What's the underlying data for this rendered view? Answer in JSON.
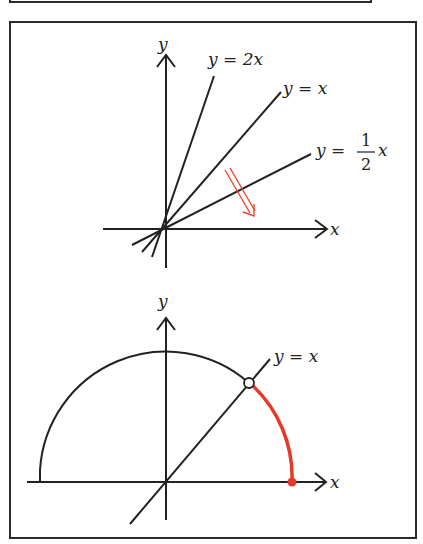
{
  "figure_top": {
    "axis_labels": {
      "x": "x",
      "y": "y"
    },
    "lines": [
      {
        "name": "y = 2x",
        "label": "y = 2x",
        "slope": 2
      },
      {
        "name": "y = x",
        "label": "y = x",
        "slope": 1
      },
      {
        "name": "y = 1/2 x",
        "label_prefix": "y =",
        "frac_num": "1",
        "frac_den": "2",
        "label_suffix": "x",
        "slope": 0.5
      }
    ],
    "arrow": {
      "color": "#e8472f",
      "meaning": "rotate slope downward"
    }
  },
  "figure_bottom": {
    "axis_labels": {
      "x": "x",
      "y": "y"
    },
    "line_label": "y = x",
    "semicircle": {
      "color": "#222222"
    },
    "highlight_arc": {
      "color": "#e53a2a",
      "from_deg": 0,
      "to_deg": 45
    },
    "open_point": "intersection of circle and y = x",
    "closed_point": {
      "color": "#e53a2a",
      "location": "circle meets positive x-axis"
    }
  },
  "colors": {
    "ink": "#222222",
    "accent": "#e53a2a",
    "frame": "#2b2b2b"
  }
}
